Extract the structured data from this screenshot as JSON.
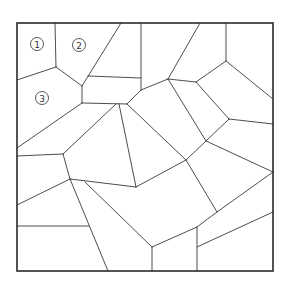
{
  "diagram": {
    "type": "voronoi-tessellation",
    "colors": {
      "line": "#3a3a3a",
      "frame": "#2a2a2a",
      "background": "#ffffff"
    },
    "frame": {
      "x1": 17,
      "y1": 23,
      "x2": 273,
      "y2": 271
    },
    "labels": [
      {
        "text": "1",
        "cx": 37,
        "cy": 44
      },
      {
        "text": "2",
        "cx": 79,
        "cy": 45
      },
      {
        "text": "3",
        "cx": 42,
        "cy": 98
      }
    ],
    "edges": [
      [
        55,
        23,
        56,
        67
      ],
      [
        56,
        67,
        17,
        80
      ],
      [
        56,
        67,
        82,
        86
      ],
      [
        82,
        86,
        82,
        103
      ],
      [
        121,
        23,
        82,
        86
      ],
      [
        88,
        76,
        141,
        78
      ],
      [
        141,
        23,
        141,
        90
      ],
      [
        141,
        90,
        127,
        104
      ],
      [
        82,
        103,
        127,
        104
      ],
      [
        82,
        103,
        17,
        148
      ],
      [
        116,
        104,
        63,
        154
      ],
      [
        63,
        154,
        17,
        156
      ],
      [
        119,
        104,
        136,
        187
      ],
      [
        63,
        154,
        70,
        179
      ],
      [
        70,
        179,
        17,
        205
      ],
      [
        70,
        179,
        136,
        187
      ],
      [
        70,
        179,
        108,
        271
      ],
      [
        17,
        226,
        89,
        226
      ],
      [
        85,
        182,
        152,
        247
      ],
      [
        152,
        247,
        152,
        271
      ],
      [
        152,
        247,
        197,
        227
      ],
      [
        197,
        227,
        197,
        271
      ],
      [
        197,
        247,
        273,
        212
      ],
      [
        136,
        187,
        186,
        160
      ],
      [
        127,
        104,
        186,
        160
      ],
      [
        186,
        160,
        217,
        212
      ],
      [
        197,
        227,
        217,
        212
      ],
      [
        217,
        212,
        273,
        172
      ],
      [
        141,
        90,
        168,
        79
      ],
      [
        200,
        23,
        168,
        79
      ],
      [
        168,
        79,
        196,
        82
      ],
      [
        168,
        79,
        206,
        141
      ],
      [
        196,
        82,
        226,
        61
      ],
      [
        226,
        23,
        226,
        61
      ],
      [
        226,
        61,
        273,
        99
      ],
      [
        196,
        82,
        229,
        119
      ],
      [
        229,
        119,
        273,
        124
      ],
      [
        229,
        119,
        206,
        141
      ],
      [
        206,
        141,
        186,
        160
      ],
      [
        206,
        141,
        273,
        172
      ]
    ]
  }
}
